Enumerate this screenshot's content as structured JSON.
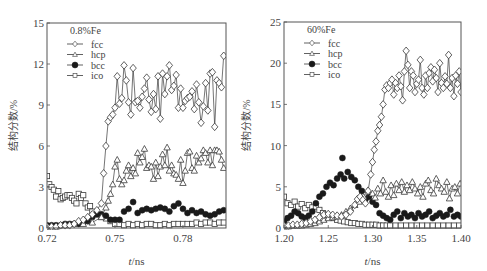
{
  "figure": {
    "width": 487,
    "height": 271,
    "background": "#ffffff",
    "ink": "#3a3a3a"
  },
  "chart_data": [
    {
      "id": "left",
      "type": "line",
      "title": "0.8%Fe",
      "xlabel": "t/ns",
      "ylabel": "结构分数/%",
      "xlim": [
        0.72,
        0.799
      ],
      "ylim": [
        0,
        15
      ],
      "xticks": [
        0.72,
        0.75,
        0.78
      ],
      "xtick_labels": [
        "0.72",
        "0.75",
        "0.78"
      ],
      "yticks": [
        0,
        3,
        6,
        9,
        12,
        15
      ],
      "ytick_labels": [
        "0",
        "3",
        "6",
        "9",
        "12",
        "15"
      ],
      "grid": false,
      "legend": {
        "position": "upper-left",
        "entries": [
          "fcc",
          "hcp",
          "bcc",
          "ico"
        ]
      },
      "box": {
        "left": 47,
        "top": 23,
        "right": 226,
        "bottom": 228
      },
      "series": [
        {
          "name": "fcc",
          "marker": "diamond-open",
          "line": true,
          "x": [
            0.72,
            0.722,
            0.724,
            0.726,
            0.728,
            0.73,
            0.732,
            0.734,
            0.736,
            0.738,
            0.74,
            0.742,
            0.744,
            0.745,
            0.746,
            0.747,
            0.748,
            0.749,
            0.75,
            0.751,
            0.752,
            0.753,
            0.754,
            0.755,
            0.756,
            0.757,
            0.758,
            0.759,
            0.76,
            0.761,
            0.762,
            0.763,
            0.764,
            0.765,
            0.766,
            0.767,
            0.768,
            0.769,
            0.77,
            0.771,
            0.772,
            0.773,
            0.774,
            0.775,
            0.776,
            0.777,
            0.778,
            0.779,
            0.78,
            0.781,
            0.782,
            0.783,
            0.784,
            0.785,
            0.786,
            0.787,
            0.788,
            0.789,
            0.79,
            0.791,
            0.792,
            0.793,
            0.794,
            0.795,
            0.796,
            0.797,
            0.798
          ],
          "y": [
            0.1,
            0.1,
            0.1,
            0.2,
            0.2,
            0.2,
            0.3,
            0.5,
            0.6,
            0.8,
            1.0,
            1.3,
            1.8,
            4.0,
            6.0,
            7.8,
            8.1,
            8.3,
            8.8,
            11.1,
            9.1,
            9.5,
            11.9,
            10.8,
            9.2,
            8.3,
            11.7,
            9.2,
            9.3,
            8.8,
            9.6,
            10.2,
            11.0,
            9.4,
            8.5,
            9.8,
            8.7,
            11.1,
            8.0,
            11.3,
            9.8,
            11.1,
            11.9,
            10.1,
            10.4,
            11.2,
            8.8,
            10.2,
            8.8,
            9.3,
            9.5,
            9.6,
            10.0,
            8.7,
            10.5,
            9.2,
            7.7,
            8.9,
            10.6,
            8.6,
            11.3,
            11.4,
            7.4,
            10.8,
            10.6,
            10.3,
            12.6
          ]
        },
        {
          "name": "hcp",
          "marker": "triangle-open",
          "line": true,
          "x": [
            0.72,
            0.724,
            0.728,
            0.732,
            0.736,
            0.74,
            0.744,
            0.746,
            0.747,
            0.748,
            0.749,
            0.75,
            0.751,
            0.752,
            0.753,
            0.754,
            0.755,
            0.756,
            0.757,
            0.758,
            0.759,
            0.76,
            0.761,
            0.762,
            0.763,
            0.764,
            0.765,
            0.766,
            0.767,
            0.768,
            0.769,
            0.77,
            0.771,
            0.772,
            0.773,
            0.774,
            0.775,
            0.776,
            0.777,
            0.778,
            0.779,
            0.78,
            0.781,
            0.782,
            0.783,
            0.784,
            0.785,
            0.786,
            0.787,
            0.788,
            0.789,
            0.79,
            0.791,
            0.792,
            0.793,
            0.794,
            0.795,
            0.796,
            0.797,
            0.798
          ],
          "y": [
            0.1,
            0.1,
            0.2,
            0.3,
            0.3,
            0.4,
            0.8,
            1.5,
            2.0,
            2.5,
            3.2,
            4.5,
            5.0,
            3.6,
            3.2,
            3.5,
            4.2,
            4.6,
            3.8,
            4.4,
            4.0,
            5.5,
            4.8,
            5.2,
            5.8,
            4.4,
            4.6,
            4.5,
            3.6,
            4.8,
            3.8,
            4.5,
            5.4,
            4.6,
            5.9,
            4.2,
            4.6,
            4.0,
            3.9,
            3.6,
            5.0,
            3.3,
            4.2,
            5.5,
            5.6,
            4.4,
            4.2,
            5.3,
            4.8,
            5.1,
            5.7,
            5.5,
            4.8,
            5.7,
            4.6,
            5.7,
            5.7,
            5.6,
            5.0,
            4.4
          ]
        },
        {
          "name": "bcc",
          "marker": "circle-filled",
          "line": false,
          "x": [
            0.72,
            0.722,
            0.724,
            0.726,
            0.728,
            0.73,
            0.732,
            0.734,
            0.736,
            0.738,
            0.74,
            0.742,
            0.744,
            0.746,
            0.748,
            0.75,
            0.752,
            0.754,
            0.756,
            0.758,
            0.76,
            0.762,
            0.764,
            0.766,
            0.768,
            0.77,
            0.772,
            0.774,
            0.776,
            0.778,
            0.78,
            0.782,
            0.784,
            0.786,
            0.788,
            0.79,
            0.792,
            0.794,
            0.796,
            0.798
          ],
          "y": [
            0.2,
            0.2,
            0.2,
            0.2,
            0.3,
            0.3,
            0.3,
            0.3,
            0.4,
            0.5,
            0.8,
            1.0,
            1.0,
            0.9,
            0.6,
            0.6,
            0.6,
            1.2,
            1.4,
            1.9,
            1.1,
            1.3,
            1.4,
            1.3,
            1.4,
            1.5,
            1.4,
            1.2,
            1.6,
            1.8,
            1.4,
            1.1,
            1.3,
            1.1,
            1.2,
            1.0,
            0.9,
            1.0,
            1.2,
            1.3
          ]
        },
        {
          "name": "ico",
          "marker": "square-open",
          "line": false,
          "x": [
            0.72,
            0.721,
            0.722,
            0.723,
            0.724,
            0.725,
            0.726,
            0.727,
            0.728,
            0.729,
            0.73,
            0.731,
            0.732,
            0.733,
            0.734,
            0.735,
            0.736,
            0.737,
            0.738,
            0.739,
            0.74,
            0.742,
            0.744,
            0.746,
            0.748,
            0.75,
            0.752,
            0.754,
            0.756,
            0.758,
            0.76,
            0.762,
            0.764,
            0.766,
            0.768,
            0.77,
            0.772,
            0.774,
            0.776,
            0.778,
            0.78,
            0.782,
            0.784,
            0.786,
            0.788,
            0.79,
            0.792,
            0.794,
            0.796,
            0.798
          ],
          "y": [
            3.8,
            3.2,
            3.0,
            2.8,
            2.3,
            2.7,
            2.1,
            2.2,
            2.3,
            2.4,
            2.4,
            2.2,
            2.0,
            1.8,
            2.5,
            2.2,
            2.4,
            1.8,
            1.5,
            1.6,
            1.2,
            1.0,
            0.8,
            0.7,
            0.5,
            0.3,
            0.3,
            0.2,
            0.3,
            0.2,
            0.3,
            0.2,
            0.3,
            0.3,
            0.2,
            0.2,
            0.3,
            0.2,
            0.3,
            0.3,
            0.3,
            0.3,
            0.3,
            0.4,
            0.3,
            0.4,
            0.4,
            0.3,
            0.4,
            0.4
          ]
        }
      ]
    },
    {
      "id": "right",
      "type": "line",
      "title": "60%Fe",
      "xlabel": "t/ns",
      "ylabel": "结构分数/%",
      "xlim": [
        1.2,
        1.4
      ],
      "ylim": [
        0,
        25
      ],
      "xticks": [
        1.2,
        1.25,
        1.3,
        1.35,
        1.4
      ],
      "xtick_labels": [
        "1.20",
        "1.25",
        "1.30",
        "1.35",
        "1.40"
      ],
      "yticks": [
        0,
        5,
        10,
        15,
        20,
        25
      ],
      "ytick_labels": [
        "0",
        "5",
        "10",
        "15",
        "20",
        "25"
      ],
      "grid": false,
      "legend": {
        "position": "upper-left",
        "entries": [
          "fcc",
          "hcp",
          "bcc",
          "ico"
        ]
      },
      "box": {
        "left": 284,
        "top": 22,
        "right": 461,
        "bottom": 228
      },
      "series": [
        {
          "name": "fcc",
          "marker": "diamond-open",
          "line": true,
          "x": [
            1.2,
            1.205,
            1.21,
            1.215,
            1.22,
            1.225,
            1.23,
            1.235,
            1.24,
            1.245,
            1.25,
            1.255,
            1.26,
            1.265,
            1.27,
            1.275,
            1.28,
            1.283,
            1.286,
            1.289,
            1.292,
            1.295,
            1.298,
            1.3,
            1.302,
            1.304,
            1.306,
            1.308,
            1.31,
            1.312,
            1.314,
            1.316,
            1.318,
            1.32,
            1.322,
            1.324,
            1.326,
            1.328,
            1.33,
            1.332,
            1.334,
            1.336,
            1.338,
            1.34,
            1.342,
            1.344,
            1.346,
            1.348,
            1.35,
            1.352,
            1.354,
            1.356,
            1.358,
            1.36,
            1.362,
            1.364,
            1.366,
            1.368,
            1.37,
            1.372,
            1.374,
            1.376,
            1.378,
            1.38,
            1.382,
            1.384,
            1.386,
            1.388,
            1.39,
            1.392,
            1.394,
            1.396,
            1.398,
            1.4
          ],
          "y": [
            0.3,
            0.3,
            0.4,
            0.4,
            0.5,
            0.6,
            0.8,
            1.0,
            1.3,
            1.6,
            1.7,
            1.6,
            1.5,
            1.4,
            1.6,
            2.0,
            2.8,
            3.5,
            3.8,
            3.4,
            3.0,
            4.5,
            6.5,
            8.0,
            9.5,
            10.5,
            11.8,
            12.5,
            13.5,
            15.0,
            16.8,
            17.3,
            17.0,
            17.6,
            18.0,
            16.2,
            17.6,
            17.0,
            18.5,
            17.2,
            15.5,
            19.0,
            21.5,
            19.8,
            17.0,
            19.0,
            18.5,
            16.5,
            17.5,
            18.0,
            20.4,
            17.0,
            16.2,
            18.5,
            17.0,
            18.8,
            19.5,
            17.8,
            19.2,
            18.2,
            16.5,
            20.0,
            17.6,
            17.0,
            18.4,
            17.5,
            21.0,
            17.0,
            18.2,
            16.0,
            18.5,
            17.5,
            19.0,
            16.5
          ]
        },
        {
          "name": "hcp",
          "marker": "triangle-open",
          "line": true,
          "x": [
            1.2,
            1.205,
            1.21,
            1.215,
            1.22,
            1.225,
            1.23,
            1.235,
            1.24,
            1.245,
            1.25,
            1.255,
            1.26,
            1.265,
            1.27,
            1.275,
            1.28,
            1.285,
            1.29,
            1.295,
            1.3,
            1.303,
            1.306,
            1.309,
            1.312,
            1.315,
            1.318,
            1.321,
            1.324,
            1.327,
            1.33,
            1.333,
            1.336,
            1.339,
            1.342,
            1.345,
            1.348,
            1.351,
            1.354,
            1.357,
            1.36,
            1.363,
            1.366,
            1.369,
            1.372,
            1.375,
            1.378,
            1.381,
            1.384,
            1.387,
            1.39,
            1.393,
            1.396,
            1.399
          ],
          "y": [
            0.2,
            0.2,
            0.3,
            0.3,
            0.3,
            0.4,
            0.5,
            0.6,
            0.8,
            1.0,
            1.2,
            1.3,
            1.4,
            1.6,
            2.0,
            2.4,
            2.8,
            3.2,
            3.8,
            4.6,
            4.2,
            3.7,
            4.8,
            4.2,
            5.8,
            4.4,
            3.8,
            5.2,
            4.0,
            5.4,
            4.6,
            5.6,
            4.4,
            5.2,
            4.6,
            5.6,
            4.8,
            4.2,
            5.0,
            3.8,
            5.4,
            5.8,
            4.6,
            4.2,
            6.0,
            5.2,
            4.8,
            4.4,
            5.6,
            3.6,
            4.8,
            5.0,
            4.2,
            5.4
          ]
        },
        {
          "name": "bcc",
          "marker": "circle-filled",
          "line": false,
          "x": [
            1.2,
            1.204,
            1.208,
            1.212,
            1.216,
            1.22,
            1.224,
            1.228,
            1.232,
            1.236,
            1.24,
            1.244,
            1.248,
            1.252,
            1.256,
            1.26,
            1.264,
            1.266,
            1.268,
            1.272,
            1.276,
            1.28,
            1.284,
            1.288,
            1.292,
            1.296,
            1.3,
            1.304,
            1.308,
            1.312,
            1.316,
            1.32,
            1.324,
            1.328,
            1.332,
            1.336,
            1.34,
            1.344,
            1.348,
            1.352,
            1.356,
            1.36,
            1.364,
            1.368,
            1.372,
            1.376,
            1.38,
            1.384,
            1.388,
            1.392,
            1.396,
            1.4
          ],
          "y": [
            0.8,
            1.2,
            1.5,
            2.0,
            1.8,
            1.4,
            1.2,
            1.5,
            2.0,
            3.0,
            3.8,
            4.2,
            5.0,
            5.5,
            5.2,
            6.0,
            6.5,
            8.5,
            6.0,
            6.8,
            6.2,
            5.8,
            5.0,
            4.5,
            3.5,
            3.8,
            3.2,
            2.8,
            1.8,
            1.5,
            1.2,
            1.0,
            1.6,
            2.0,
            1.2,
            1.8,
            1.4,
            1.6,
            1.2,
            1.8,
            1.4,
            1.6,
            2.0,
            1.2,
            1.5,
            1.8,
            1.4,
            1.6,
            2.2,
            1.4,
            1.6,
            1.4
          ]
        },
        {
          "name": "ico",
          "marker": "square-open",
          "line": false,
          "x": [
            1.2,
            1.204,
            1.208,
            1.212,
            1.216,
            1.22,
            1.224,
            1.228,
            1.232,
            1.236,
            1.24,
            1.244,
            1.248,
            1.252,
            1.256,
            1.26,
            1.264,
            1.268,
            1.272,
            1.276,
            1.28,
            1.284,
            1.288,
            1.292,
            1.296,
            1.3,
            1.304,
            1.308,
            1.312,
            1.316,
            1.32,
            1.326,
            1.332,
            1.338,
            1.344,
            1.35,
            1.356,
            1.362,
            1.368,
            1.374,
            1.38,
            1.386,
            1.392,
            1.398
          ],
          "y": [
            3.8,
            3.0,
            2.8,
            3.2,
            2.6,
            2.9,
            2.4,
            2.8,
            2.5,
            2.6,
            2.2,
            1.8,
            1.6,
            1.4,
            1.2,
            1.0,
            0.9,
            0.8,
            0.7,
            0.6,
            0.6,
            0.5,
            0.5,
            0.4,
            0.4,
            0.4,
            0.4,
            0.3,
            0.3,
            0.3,
            0.3,
            0.3,
            0.3,
            0.3,
            0.3,
            0.3,
            0.3,
            0.3,
            0.3,
            0.3,
            0.3,
            0.3,
            0.3,
            0.3
          ]
        }
      ]
    }
  ]
}
